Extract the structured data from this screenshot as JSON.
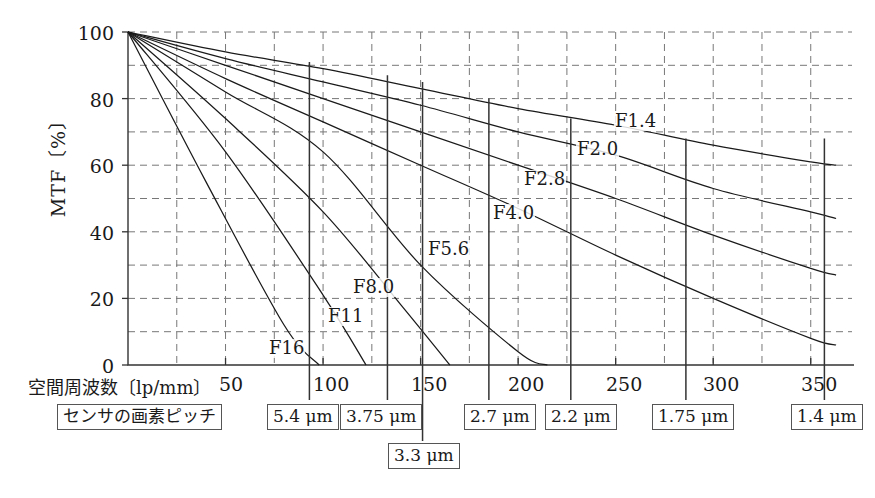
{
  "figure": {
    "title": "",
    "caption": ""
  },
  "axes": {
    "ylabel": "MTF〔%〕",
    "xlabel": "空間周波数〔lp/mm〕",
    "yticks": [
      "0",
      "20",
      "40",
      "60",
      "80",
      "100"
    ],
    "xticks": [
      "50",
      "100",
      "150",
      "200",
      "250",
      "300",
      "350"
    ]
  },
  "legend": {
    "labels": [
      "F1.4",
      "F2.0",
      "F2.8",
      "F4.0",
      "F5.6",
      "F8.0",
      "F11",
      "F16"
    ]
  },
  "pitch": {
    "row_label": "センサの画素ピッチ",
    "boxes": [
      {
        "label": "5.4 μm",
        "value": "5.4",
        "unit": "μm"
      },
      {
        "label": "3.75 μm",
        "value": "3.75",
        "unit": "μm"
      },
      {
        "label": "3.3 μm",
        "value": "3.3",
        "unit": "μm"
      },
      {
        "label": "2.7 μm",
        "value": "2.7",
        "unit": "μm"
      },
      {
        "label": "2.2 μm",
        "value": "2.2",
        "unit": "μm"
      },
      {
        "label": "1.75 μm",
        "value": "1.75",
        "unit": "μm"
      },
      {
        "label": "1.4 μm",
        "value": "1.4",
        "unit": "μm"
      }
    ]
  },
  "chart_data": {
    "type": "line",
    "title": "",
    "xlabel": "空間周波数〔lp/mm〕",
    "ylabel": "MTF〔%〕",
    "xlim": [
      0,
      365
    ],
    "ylim": [
      0,
      100
    ],
    "xticks": [
      50,
      100,
      150,
      200,
      250,
      300,
      350
    ],
    "yticks": [
      0,
      20,
      40,
      60,
      80,
      100
    ],
    "grid": "dashed, every 10 units on y and every 25 lp/mm on x",
    "legend_position": "inline labels at curve ends",
    "series": [
      {
        "name": "F1.4",
        "color": "#1a1a1a",
        "x": [
          0,
          50,
          100,
          150,
          200,
          250,
          300,
          350,
          363
        ],
        "y": [
          100,
          94,
          89,
          83,
          77,
          72,
          66,
          61,
          60
        ]
      },
      {
        "name": "F2.0",
        "color": "#1a1a1a",
        "x": [
          0,
          50,
          100,
          150,
          200,
          250,
          300,
          350,
          363
        ],
        "y": [
          100,
          92,
          85,
          78,
          70,
          63,
          53,
          46,
          44
        ]
      },
      {
        "name": "F2.8",
        "color": "#1a1a1a",
        "x": [
          0,
          50,
          100,
          150,
          200,
          250,
          300,
          350,
          363
        ],
        "y": [
          100,
          90,
          80,
          70,
          60,
          50,
          39,
          29,
          27
        ]
      },
      {
        "name": "F4.0",
        "color": "#1a1a1a",
        "x": [
          0,
          50,
          100,
          150,
          200,
          250,
          300,
          350,
          363
        ],
        "y": [
          100,
          86,
          73,
          60,
          47,
          33,
          20,
          8,
          6
        ]
      },
      {
        "name": "F5.6",
        "color": "#1a1a1a",
        "x": [
          0,
          50,
          100,
          150,
          200,
          215
        ],
        "y": [
          100,
          82,
          64,
          30,
          4,
          0
        ]
      },
      {
        "name": "F8.0",
        "color": "#1a1a1a",
        "x": [
          0,
          50,
          100,
          140,
          165
        ],
        "y": [
          100,
          74,
          46,
          18,
          0
        ]
      },
      {
        "name": "F11",
        "color": "#1a1a1a",
        "x": [
          0,
          50,
          100,
          122
        ],
        "y": [
          100,
          64,
          21,
          0
        ]
      },
      {
        "name": "F16",
        "color": "#1a1a1a",
        "x": [
          0,
          40,
          80,
          98
        ],
        "y": [
          100,
          55,
          12,
          0
        ]
      }
    ],
    "sensor_lines": [
      {
        "pitch": "5.4 μm",
        "frequency": 93,
        "mtf_top": 91
      },
      {
        "pitch": "3.75 μm",
        "frequency": 133,
        "mtf_top": 87
      },
      {
        "pitch": "3.3 μm",
        "frequency": 151,
        "mtf_top": 85
      },
      {
        "pitch": "2.7 μm",
        "frequency": 185,
        "mtf_top": 80
      },
      {
        "pitch": "2.2 μm",
        "frequency": 227,
        "mtf_top": 74
      },
      {
        "pitch": "1.75 μm",
        "frequency": 286,
        "mtf_top": 68
      },
      {
        "pitch": "1.4 μm",
        "frequency": 357,
        "mtf_top": 68
      }
    ]
  }
}
